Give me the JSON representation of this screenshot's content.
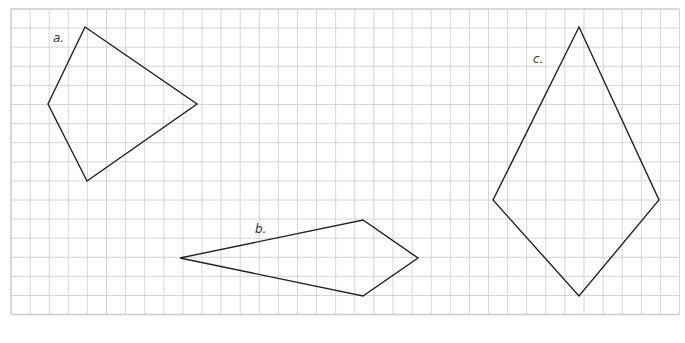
{
  "diagram": {
    "type": "quadrilaterals-on-grid",
    "grid": {
      "origin_x": 11,
      "origin_y": 9,
      "cell": 19.1,
      "cols": 35,
      "rows": 16,
      "color": "#cccccc"
    },
    "shapes": [
      {
        "label": "a.",
        "label_pos": [
          53,
          42
        ],
        "points": [
          [
            85,
            27
          ],
          [
            197,
            104
          ],
          [
            87,
            181
          ],
          [
            48,
            104
          ]
        ]
      },
      {
        "label": "b.",
        "label_pos": [
          255,
          233
        ],
        "points": [
          [
            180,
            258
          ],
          [
            363,
            220
          ],
          [
            418,
            258
          ],
          [
            363,
            296
          ]
        ]
      },
      {
        "label": "c.",
        "label_pos": [
          533,
          63
        ],
        "points": [
          [
            579,
            27
          ],
          [
            659,
            200
          ],
          [
            579,
            296
          ],
          [
            493,
            200
          ]
        ]
      }
    ],
    "stroke_color": "#222222"
  }
}
